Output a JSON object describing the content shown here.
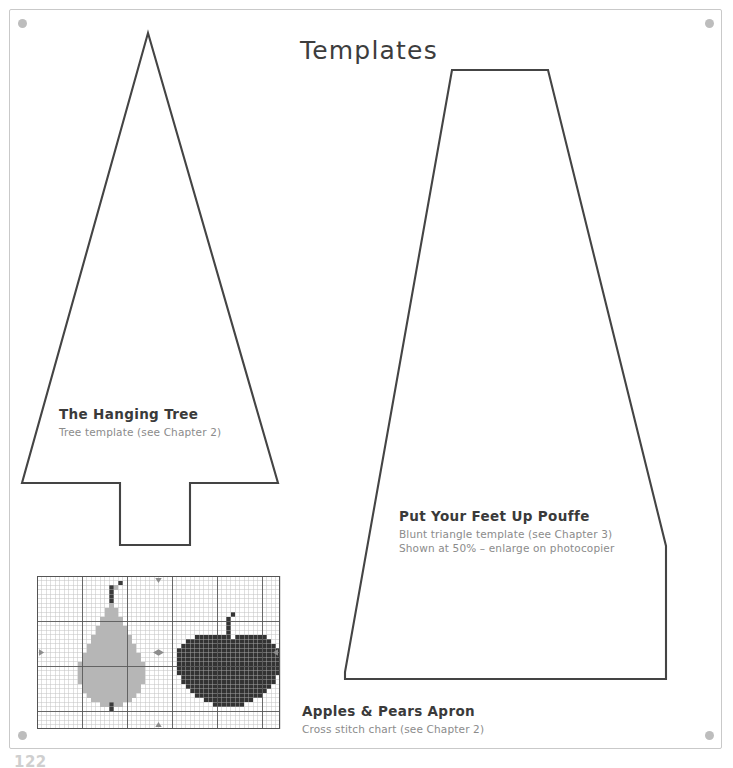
{
  "page": {
    "title": "Templates",
    "page_number": "122",
    "registration_marks": [
      "top-left",
      "top-right",
      "bottom-left",
      "bottom-right"
    ],
    "ink_color": "#3d3d3d",
    "subtitle_color": "#8b8b8b",
    "frame_color": "#c9c9c9"
  },
  "templates": [
    {
      "id": "hanging-tree",
      "title": "The Hanging Tree",
      "subtitle": "Tree template (see Chapter 2)",
      "shape": "tree-with-trunk-notch",
      "outline_color": "#444444"
    },
    {
      "id": "pouffe",
      "title": "Put Your Feet Up Pouffe",
      "subtitle": "Blunt triangle template (see Chapter 3)",
      "subtitle2": "Shown at 50% – enlarge on photocopier",
      "shape": "blunt-triangle",
      "outline_color": "#444444"
    },
    {
      "id": "apples-pears-apron",
      "title": "Apples & Pears Apron",
      "subtitle": "Cross stitch chart (see Chapter 2)",
      "shape": "cross-stitch-grid",
      "outline_color": "#555555"
    }
  ],
  "chart_data": {
    "type": "heatmap",
    "title": "Apples & Pears Apron",
    "cols": 54,
    "rows": 34,
    "cell_px": 4.5,
    "grid": true,
    "grid_minor_color": "#b8b8b8",
    "grid_major_color": "#5a5a5a",
    "border_color": "#555555",
    "legend": [
      {
        "name": "pear-body",
        "color": "#b6b6b6"
      },
      {
        "name": "pear-stem",
        "color": "#3a3a3a"
      },
      {
        "name": "apple-body",
        "color": "#333333"
      },
      {
        "name": "apple-stem",
        "color": "#333333"
      },
      {
        "name": "empty",
        "color": "#ffffff"
      }
    ],
    "centre_markers": [
      "left",
      "right",
      "top",
      "bottom",
      "centre"
    ],
    "motifs": [
      {
        "name": "pear",
        "color": "#b6b6b6",
        "stem_color": "#3a3a3a",
        "origin_col": 9,
        "rows": [
          {
            "r": 2,
            "spans": [
              [
                8,
                9
              ]
            ]
          },
          {
            "r": 3,
            "spans": [
              [
                7,
                8
              ]
            ]
          },
          {
            "r": 4,
            "spans": [
              [
                7,
                8
              ]
            ]
          },
          {
            "r": 5,
            "spans": [
              [
                7,
                8
              ]
            ]
          },
          {
            "r": 6,
            "spans": [
              [
                7,
                8
              ]
            ]
          },
          {
            "r": 7,
            "spans": [
              [
                6,
                9
              ]
            ]
          },
          {
            "r": 8,
            "spans": [
              [
                6,
                9
              ]
            ]
          },
          {
            "r": 9,
            "spans": [
              [
                5,
                10
              ]
            ]
          },
          {
            "r": 10,
            "spans": [
              [
                5,
                10
              ]
            ]
          },
          {
            "r": 11,
            "spans": [
              [
                4,
                11
              ]
            ]
          },
          {
            "r": 12,
            "spans": [
              [
                4,
                11
              ]
            ]
          },
          {
            "r": 13,
            "spans": [
              [
                3,
                12
              ]
            ]
          },
          {
            "r": 14,
            "spans": [
              [
                3,
                12
              ]
            ]
          },
          {
            "r": 15,
            "spans": [
              [
                2,
                13
              ]
            ]
          },
          {
            "r": 16,
            "spans": [
              [
                2,
                13
              ]
            ]
          },
          {
            "r": 17,
            "spans": [
              [
                1,
                14
              ]
            ]
          },
          {
            "r": 18,
            "spans": [
              [
                1,
                14
              ]
            ]
          },
          {
            "r": 19,
            "spans": [
              [
                0,
                15
              ]
            ]
          },
          {
            "r": 20,
            "spans": [
              [
                0,
                15
              ]
            ]
          },
          {
            "r": 21,
            "spans": [
              [
                0,
                15
              ]
            ]
          },
          {
            "r": 22,
            "spans": [
              [
                0,
                15
              ]
            ]
          },
          {
            "r": 23,
            "spans": [
              [
                0,
                15
              ]
            ]
          },
          {
            "r": 24,
            "spans": [
              [
                1,
                14
              ]
            ]
          },
          {
            "r": 25,
            "spans": [
              [
                1,
                14
              ]
            ]
          },
          {
            "r": 26,
            "spans": [
              [
                2,
                13
              ]
            ]
          },
          {
            "r": 27,
            "spans": [
              [
                3,
                12
              ]
            ]
          },
          {
            "r": 28,
            "spans": [
              [
                5,
                10
              ]
            ]
          }
        ],
        "stem_rows": [
          {
            "r": 1,
            "spans": [
              [
                9,
                10
              ]
            ]
          },
          {
            "r": 2,
            "spans": [
              [
                7,
                8
              ]
            ]
          },
          {
            "r": 3,
            "spans": [
              [
                7,
                8
              ]
            ]
          },
          {
            "r": 4,
            "spans": [
              [
                7,
                8
              ]
            ]
          },
          {
            "r": 5,
            "spans": [
              [
                7,
                8
              ]
            ]
          },
          {
            "r": 28,
            "spans": [
              [
                7,
                8
              ]
            ]
          },
          {
            "r": 29,
            "spans": [
              [
                7,
                8
              ]
            ]
          }
        ]
      },
      {
        "name": "apple",
        "color": "#333333",
        "stem_color": "#333333",
        "origin_col": 31,
        "rows": [
          {
            "r": 13,
            "spans": [
              [
                4,
                11
              ],
              [
                13,
                20
              ]
            ]
          },
          {
            "r": 14,
            "spans": [
              [
                2,
                21
              ]
            ]
          },
          {
            "r": 15,
            "spans": [
              [
                1,
                22
              ]
            ]
          },
          {
            "r": 16,
            "spans": [
              [
                0,
                23
              ]
            ]
          },
          {
            "r": 17,
            "spans": [
              [
                0,
                23
              ]
            ]
          },
          {
            "r": 18,
            "spans": [
              [
                0,
                23
              ]
            ]
          },
          {
            "r": 19,
            "spans": [
              [
                0,
                23
              ]
            ]
          },
          {
            "r": 20,
            "spans": [
              [
                0,
                23
              ]
            ]
          },
          {
            "r": 21,
            "spans": [
              [
                0,
                23
              ]
            ]
          },
          {
            "r": 22,
            "spans": [
              [
                1,
                22
              ]
            ]
          },
          {
            "r": 23,
            "spans": [
              [
                1,
                22
              ]
            ]
          },
          {
            "r": 24,
            "spans": [
              [
                2,
                21
              ]
            ]
          },
          {
            "r": 25,
            "spans": [
              [
                3,
                20
              ]
            ]
          },
          {
            "r": 26,
            "spans": [
              [
                4,
                19
              ]
            ]
          },
          {
            "r": 27,
            "spans": [
              [
                6,
                17
              ]
            ]
          },
          {
            "r": 28,
            "spans": [
              [
                8,
                15
              ]
            ]
          }
        ],
        "stem_rows": [
          {
            "r": 8,
            "spans": [
              [
                12,
                13
              ]
            ]
          },
          {
            "r": 9,
            "spans": [
              [
                11,
                12
              ]
            ]
          },
          {
            "r": 10,
            "spans": [
              [
                11,
                12
              ]
            ]
          },
          {
            "r": 11,
            "spans": [
              [
                11,
                12
              ]
            ]
          },
          {
            "r": 12,
            "spans": [
              [
                11,
                12
              ]
            ]
          },
          {
            "r": 13,
            "spans": [
              [
                11,
                12
              ]
            ]
          }
        ]
      }
    ]
  }
}
